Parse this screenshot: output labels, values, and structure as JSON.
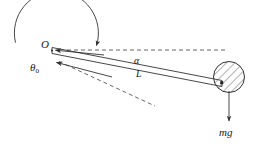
{
  "figure": {
    "background": "#ffffff",
    "stroke": "#333333",
    "hatch_color": "#555555",
    "width": 264,
    "height": 149
  },
  "labels": {
    "pivot": "O",
    "initial_angle": "θ",
    "initial_angle_sub": "0",
    "angular_accel": "α",
    "length": "L",
    "weight": "mg"
  },
  "geometry": {
    "pivot_point": {
      "x": 52,
      "y": 50
    },
    "circle": {
      "cx": 55,
      "cy": 57,
      "r": 42
    },
    "rotation_arc": {
      "start_deg": 200,
      "end_deg": 8,
      "arrow_at": {
        "x": 95,
        "y": 48
      },
      "direction": "clockwise"
    },
    "horizontal_dashed_line": {
      "x1": 52,
      "y1": 50,
      "x2": 225,
      "y2": 50
    },
    "rod": {
      "from": {
        "x": 52,
        "y": 50
      },
      "to": {
        "x": 222,
        "y": 84
      },
      "thickness_px": 5
    },
    "ball": {
      "cx": 229,
      "cy": 77,
      "r": 15,
      "fill": "hatched"
    },
    "weight_vector": {
      "x1": 229,
      "y1": 92,
      "x2": 229,
      "y2": 122
    },
    "angle_arrow_alpha": {
      "from": {
        "x": 100,
        "y": 54
      },
      "to": {
        "x": 55,
        "y": 50
      }
    },
    "angle_arrow_theta": {
      "from": {
        "x": 110,
        "y": 75
      },
      "to": {
        "x": 56,
        "y": 62
      }
    },
    "dashed_reference_line": {
      "x1": 58,
      "y1": 61,
      "x2": 155,
      "y2": 106
    }
  }
}
